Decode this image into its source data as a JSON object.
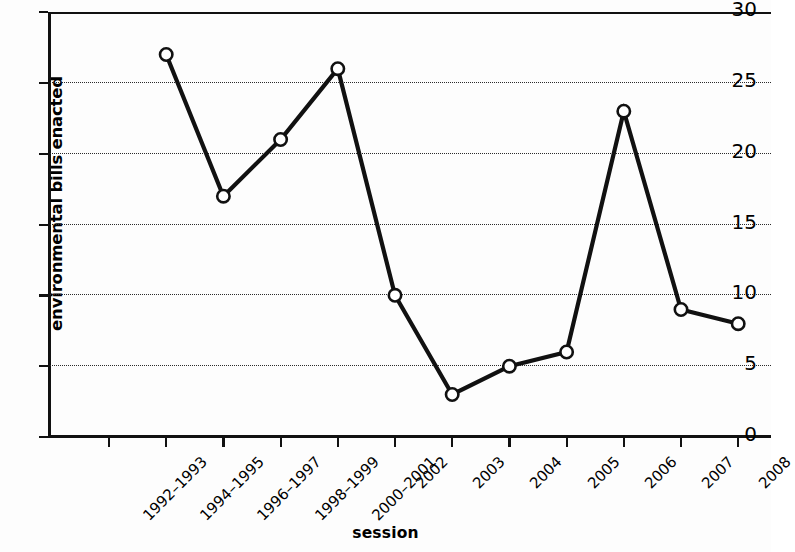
{
  "chart_data": {
    "type": "line",
    "title": "",
    "xlabel": "session",
    "ylabel": "environmental bills enacted",
    "categories": [
      "1992–1993",
      "1994–1995",
      "1996–1997",
      "1998–1999",
      "2000–2001",
      "2002",
      "2003",
      "2004",
      "2005",
      "2006",
      "2007",
      "2008"
    ],
    "values": [
      null,
      27,
      17,
      21,
      26,
      10,
      3,
      5,
      6,
      23,
      9,
      8
    ],
    "series": [
      {
        "name": "environmental bills enacted",
        "points": [
          {
            "x": "1994–1995",
            "y": 27
          },
          {
            "x": "1996–1997",
            "y": 17
          },
          {
            "x": "1998–1999",
            "y": 21
          },
          {
            "x": "2000–2001",
            "y": 26
          },
          {
            "x": "2002",
            "y": 10
          },
          {
            "x": "2003",
            "y": 3
          },
          {
            "x": "2004",
            "y": 5
          },
          {
            "x": "2005",
            "y": 6
          },
          {
            "x": "2006",
            "y": 23
          },
          {
            "x": "2007",
            "y": 9
          },
          {
            "x": "2008",
            "y": 8
          }
        ]
      }
    ],
    "ylim": [
      0,
      30
    ],
    "yticks": [
      0,
      5,
      10,
      15,
      20,
      25,
      30
    ],
    "ytick_labels": [
      "0",
      "5",
      "10",
      "15",
      "20",
      "25",
      "30"
    ],
    "grid": "horizontal-dotted",
    "gridlines_at": [
      5,
      10,
      15,
      20,
      25
    ],
    "legend": null,
    "line_color": "#111111",
    "marker_style": "open-circle",
    "marker_face_color": "#ffffff",
    "marker_edge_color": "#111111",
    "axis_color": "#111111",
    "background_color": "#ffffff"
  }
}
